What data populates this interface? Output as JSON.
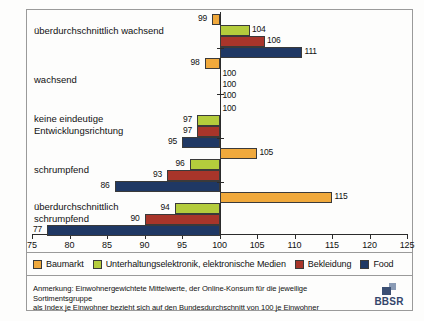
{
  "chart_data": {
    "type": "bar",
    "orientation": "horizontal",
    "title": "",
    "xlabel": "",
    "ylabel": "",
    "xlim": [
      75,
      125
    ],
    "xticks": [
      75,
      80,
      85,
      90,
      95,
      100,
      105,
      110,
      115,
      120,
      125
    ],
    "reference_value": 100,
    "grid": false,
    "legend_position": "bottom",
    "categories": [
      "überdurchschnittlich wachsend",
      "wachsend",
      "keine eindeutige Entwicklungsrichtung",
      "schrumpfend",
      "überdurchschnittlich schrumpfend"
    ],
    "series": [
      {
        "name": "Baumarkt",
        "color": "#F0A93C",
        "values": [
          99,
          98,
          100,
          105,
          115
        ]
      },
      {
        "name": "Unterhaltungselektronik, elektronische Medien",
        "color": "#B4CC3C",
        "values": [
          104,
          100,
          97,
          96,
          94
        ]
      },
      {
        "name": "Bekleidung",
        "color": "#A8352A",
        "values": [
          106,
          100,
          97,
          93,
          90
        ]
      },
      {
        "name": "Food",
        "color": "#1F3864",
        "values": [
          111,
          100,
          95,
          86,
          77
        ]
      }
    ]
  },
  "legend": {
    "items": [
      {
        "label": "Baumarkt",
        "color": "#F0A93C"
      },
      {
        "label": "Unterhaltungselektronik, elektronische Medien",
        "color": "#B4CC3C"
      },
      {
        "label": "Bekleidung",
        "color": "#A8352A"
      },
      {
        "label": "Food",
        "color": "#1F3864"
      }
    ]
  },
  "footnote": {
    "line1": "Anmerkung: Einwohnergewichtete Mittelwerte, der Online-Konsum für die jeweilige Sortimentsgruppe",
    "line2": "als Index je Einwohner bezieht sich auf den Bundesdurchschnitt von 100 je Einwohner"
  },
  "logo": {
    "text": "BBSR"
  }
}
